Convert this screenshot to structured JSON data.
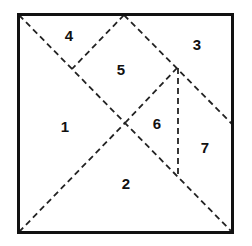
{
  "diagram": {
    "type": "tangram-square-dissection",
    "colors": {
      "background": "#ffffff",
      "outline": "#111111",
      "dashed_line": "#222222",
      "label": "#111111"
    },
    "labels": [
      {
        "text": "4",
        "x": 69,
        "y": 35
      },
      {
        "text": "3",
        "x": 197,
        "y": 44
      },
      {
        "text": "5",
        "x": 121,
        "y": 69
      },
      {
        "text": "1",
        "x": 65,
        "y": 126
      },
      {
        "text": "6",
        "x": 157,
        "y": 123
      },
      {
        "text": "7",
        "x": 205,
        "y": 147
      },
      {
        "text": "2",
        "x": 126,
        "y": 183
      }
    ]
  }
}
